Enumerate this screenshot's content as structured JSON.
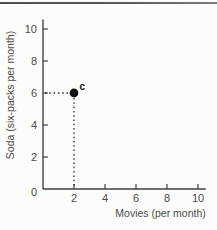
{
  "figure": {
    "background": "#fcfcfa",
    "top_rule_color": "#525356"
  },
  "chart_data": {
    "type": "scatter",
    "title": "",
    "xlabel": "Movies (per month)",
    "ylabel": "Soda (six-packs per month)",
    "xlim": [
      0,
      10.5
    ],
    "ylim": [
      0,
      10.6
    ],
    "xticks": [
      2,
      4,
      6,
      8,
      10
    ],
    "yticks": [
      0,
      2,
      4,
      6,
      8,
      10
    ],
    "grid": false,
    "legend": false,
    "points": [
      {
        "x": 2,
        "y": 6,
        "label": "c",
        "guides": "dotted-lines-to-both-axes"
      }
    ],
    "colors": {
      "axis": "#414244",
      "tick_label": "#4a4b4d",
      "axis_label": "#4a4b4d",
      "point": "#0f0f0f",
      "point_label": "#111111",
      "guide": "#2b2b2b"
    }
  }
}
